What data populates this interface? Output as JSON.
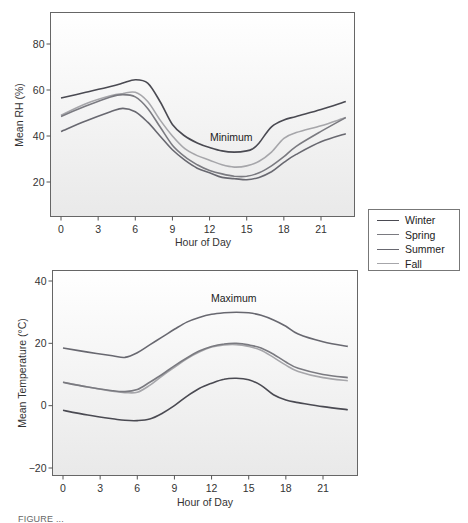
{
  "legend": {
    "items": [
      {
        "label": "Winter",
        "color": "#4a4a52"
      },
      {
        "label": "Spring",
        "color": "#7a7a80"
      },
      {
        "label": "Summer",
        "color": "#686870"
      },
      {
        "label": "Fall",
        "color": "#a6a6aa"
      }
    ]
  },
  "caption": "FIGURE ...",
  "chart_data": [
    {
      "type": "line",
      "title": "",
      "annotation": "Minimum",
      "xlabel": "Hour of Day",
      "ylabel": "Mean RH (%)",
      "xlim": [
        -0.5,
        23.5
      ],
      "ylim": [
        7,
        94
      ],
      "xticks": [
        0,
        3,
        6,
        9,
        12,
        15,
        18,
        21
      ],
      "yticks": [
        20,
        40,
        60,
        80
      ],
      "grid": false,
      "legend_position": "right, shared",
      "series": [
        {
          "name": "Winter",
          "x": [
            0,
            2,
            4,
            5,
            6,
            7,
            8,
            9,
            10,
            11,
            12,
            13,
            14,
            15,
            15.5,
            16,
            17,
            18,
            19,
            21,
            23
          ],
          "values": [
            56.5,
            59,
            61.5,
            63,
            64.5,
            63,
            55,
            45,
            40,
            37,
            35,
            33.5,
            33,
            33.5,
            34.5,
            37,
            44,
            47,
            48.5,
            51.5,
            55
          ]
        },
        {
          "name": "Spring",
          "x": [
            0,
            2,
            4,
            5,
            6,
            7,
            8,
            9,
            10,
            11,
            12,
            13,
            14,
            15,
            16,
            17,
            18,
            19,
            21,
            23
          ],
          "values": [
            48.5,
            53,
            57,
            58,
            57,
            52,
            44,
            36,
            31,
            27.5,
            25,
            23.5,
            22.5,
            22.5,
            24,
            27,
            31,
            35.5,
            42,
            48
          ]
        },
        {
          "name": "Summer",
          "x": [
            0,
            2,
            4,
            5,
            6,
            7,
            8,
            9,
            10,
            11,
            12,
            13,
            14,
            15,
            16,
            17,
            18,
            19,
            21,
            23
          ],
          "values": [
            42,
            46.5,
            50.5,
            52,
            50.5,
            46,
            40,
            34,
            29.5,
            26,
            24,
            22,
            21.5,
            21,
            22,
            24.5,
            28.5,
            32,
            37.5,
            41
          ]
        },
        {
          "name": "Fall",
          "x": [
            0,
            2,
            4,
            5,
            6,
            7,
            8,
            9,
            10,
            11,
            12,
            13,
            14,
            15,
            16,
            17,
            18,
            19,
            21,
            23
          ],
          "values": [
            49,
            54,
            57.5,
            58.5,
            59,
            55,
            47,
            40,
            34.5,
            31.5,
            29.5,
            27.5,
            26.5,
            27,
            29,
            33,
            39,
            41.5,
            44.5,
            48
          ]
        }
      ]
    },
    {
      "type": "line",
      "title": "",
      "annotation": "Maximum",
      "xlabel": "Hour of Day",
      "ylabel": "Mean Temperature (°C)",
      "xlim": [
        -0.5,
        23.5
      ],
      "ylim": [
        -22,
        43
      ],
      "xticks": [
        0,
        3,
        6,
        9,
        12,
        15,
        18,
        21
      ],
      "yticks": [
        -20,
        0,
        20,
        40
      ],
      "grid": false,
      "legend_position": "right, shared",
      "series": [
        {
          "name": "Winter",
          "x": [
            0,
            2,
            4,
            5,
            6,
            7,
            8,
            9,
            10,
            11,
            12,
            13,
            14,
            15,
            16,
            17,
            18,
            19,
            21,
            23
          ],
          "values": [
            -1.5,
            -3,
            -4.2,
            -4.7,
            -4.8,
            -4.3,
            -2.5,
            0,
            3,
            5.5,
            7.2,
            8.5,
            8.8,
            8.3,
            6.5,
            3.5,
            1.8,
            1,
            -0.3,
            -1.3
          ]
        },
        {
          "name": "Spring",
          "x": [
            0,
            2,
            4,
            5,
            6,
            7,
            8,
            9,
            10,
            11,
            12,
            13,
            14,
            15,
            16,
            17,
            18,
            19,
            21,
            23
          ],
          "values": [
            7.5,
            6,
            4.8,
            4.5,
            5.2,
            7.5,
            10,
            12.8,
            15.3,
            17.5,
            19,
            19.8,
            20,
            19.5,
            18.5,
            16.5,
            14,
            12,
            10,
            9
          ]
        },
        {
          "name": "Summer",
          "x": [
            0,
            2,
            4,
            5,
            6,
            7,
            8,
            9,
            10,
            11,
            12,
            13,
            14,
            15,
            16,
            17,
            18,
            19,
            21,
            23
          ],
          "values": [
            18.5,
            17.2,
            16,
            15.5,
            17,
            19.5,
            22,
            24.5,
            26.8,
            28.3,
            29.3,
            29.8,
            30,
            29.8,
            29,
            27.5,
            25.5,
            23,
            20.5,
            19
          ]
        },
        {
          "name": "Fall",
          "x": [
            0,
            2,
            4,
            5,
            6,
            7,
            8,
            9,
            10,
            11,
            12,
            13,
            14,
            15,
            16,
            17,
            18,
            19,
            21,
            23
          ],
          "values": [
            7.5,
            6,
            4.6,
            4.2,
            4.3,
            6.5,
            9.5,
            12.3,
            15,
            17.2,
            18.8,
            19.5,
            19.6,
            19,
            17.8,
            15.5,
            13,
            11,
            9,
            8
          ]
        }
      ]
    }
  ]
}
